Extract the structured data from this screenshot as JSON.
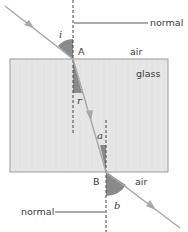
{
  "diagram": {
    "labels": {
      "normal_top": "normal",
      "normal_bottom": "normal",
      "point_a": "A",
      "point_b": "B",
      "air_top": "air",
      "air_bottom": "air",
      "glass": "glass",
      "angle_i": "i",
      "angle_r": "r",
      "angle_a": "a",
      "angle_b": "b"
    },
    "colors": {
      "glass_fill": "#e6e6e6",
      "glass_border": "#9a9a9a",
      "ray": "#a8a8a8",
      "angle_fill": "#8a8a8a",
      "line": "#444444"
    }
  }
}
